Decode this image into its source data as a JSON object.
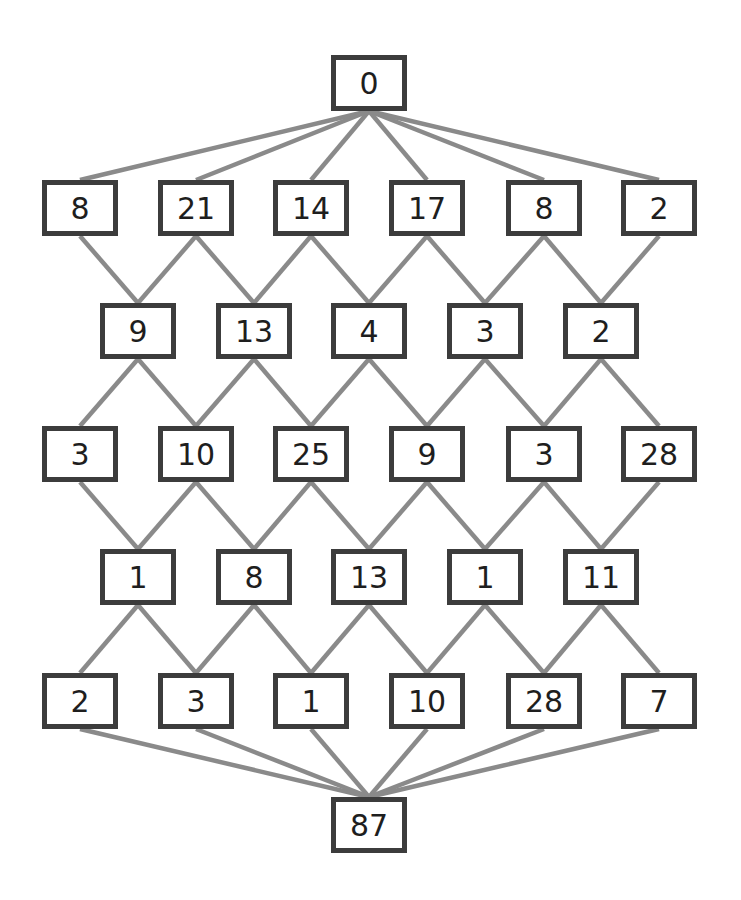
{
  "diagram": {
    "type": "layered-graph",
    "colors": {
      "node_border": "#3c3c3c",
      "edge": "#8a8a8a",
      "text": "#1e1e1e",
      "background": "#ffffff"
    },
    "rows": [
      {
        "y": 83,
        "nodes": [
          {
            "x": 369,
            "value": "0"
          }
        ]
      },
      {
        "y": 208,
        "nodes": [
          {
            "x": 80,
            "value": "8"
          },
          {
            "x": 196,
            "value": "21"
          },
          {
            "x": 311,
            "value": "14"
          },
          {
            "x": 427,
            "value": "17"
          },
          {
            "x": 544,
            "value": "8"
          },
          {
            "x": 659,
            "value": "2"
          }
        ]
      },
      {
        "y": 331,
        "nodes": [
          {
            "x": 138,
            "value": "9"
          },
          {
            "x": 254,
            "value": "13"
          },
          {
            "x": 369,
            "value": "4"
          },
          {
            "x": 485,
            "value": "3"
          },
          {
            "x": 601,
            "value": "2"
          }
        ]
      },
      {
        "y": 454,
        "nodes": [
          {
            "x": 80,
            "value": "3"
          },
          {
            "x": 196,
            "value": "10"
          },
          {
            "x": 311,
            "value": "25"
          },
          {
            "x": 427,
            "value": "9"
          },
          {
            "x": 544,
            "value": "3"
          },
          {
            "x": 659,
            "value": "28"
          }
        ]
      },
      {
        "y": 577,
        "nodes": [
          {
            "x": 138,
            "value": "1"
          },
          {
            "x": 254,
            "value": "8"
          },
          {
            "x": 369,
            "value": "13"
          },
          {
            "x": 485,
            "value": "1"
          },
          {
            "x": 601,
            "value": "11"
          }
        ]
      },
      {
        "y": 701,
        "nodes": [
          {
            "x": 80,
            "value": "2"
          },
          {
            "x": 196,
            "value": "3"
          },
          {
            "x": 311,
            "value": "1"
          },
          {
            "x": 427,
            "value": "10"
          },
          {
            "x": 544,
            "value": "28"
          },
          {
            "x": 659,
            "value": "7"
          }
        ]
      },
      {
        "y": 825,
        "nodes": [
          {
            "x": 369,
            "value": "87"
          }
        ]
      }
    ],
    "source": "0",
    "sink": "87"
  }
}
